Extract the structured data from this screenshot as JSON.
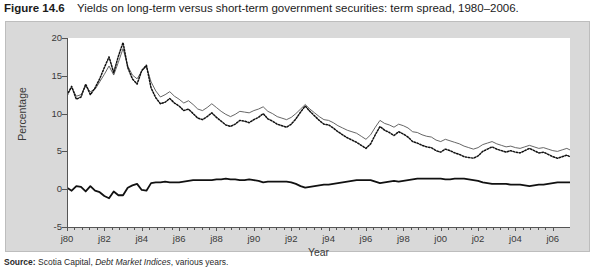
{
  "caption": {
    "figure_number": "Figure 14.6",
    "text": "Yields on long-term versus short-term government securities: term spread, 1980–2006."
  },
  "source": {
    "label": "Source:",
    "publisher": "Scotia Capital,",
    "publication": "Debt Market Indices",
    "suffix": ", various years."
  },
  "colors": {
    "panel_background": "#d9d9d9",
    "plot_background": "#ffffff",
    "axis": "#555555",
    "lt_bond": "#555555",
    "st_bond": "#111111",
    "spread": "#111111",
    "text": "#3a3a3a"
  },
  "chart_data": {
    "type": "line",
    "title": "Yields on long-term versus short-term government securities: term spread, 1980–2006",
    "xlabel": "Year",
    "ylabel": "Percentage",
    "ylim": [
      -5,
      20
    ],
    "yticks": [
      -5,
      0,
      5,
      10,
      15,
      20
    ],
    "ytick_labels": [
      "-5",
      "0",
      "5",
      "10",
      "15",
      "20"
    ],
    "xlim": [
      1980,
      2006.92
    ],
    "xticks": [
      1980,
      1982,
      1984,
      1986,
      1988,
      1990,
      1992,
      1994,
      1996,
      1998,
      2000,
      2002,
      2004,
      2006
    ],
    "xtick_labels": [
      "j80",
      "j82",
      "j84",
      "j86",
      "j88",
      "j90",
      "j92",
      "j94",
      "j96",
      "j98",
      "j00",
      "j02",
      "j04",
      "j06"
    ],
    "minor_xticks_per_interval": 4,
    "grid": false,
    "legend_position": "top-right",
    "x_start": 1980.0,
    "x_step": 0.25,
    "series": [
      {
        "name": "LT bond",
        "style": "solid-thin",
        "color": "#555555",
        "values": [
          12.6,
          13.4,
          12.3,
          12.5,
          13.6,
          12.9,
          13.2,
          14.2,
          15.2,
          16.3,
          15.1,
          16.8,
          18.6,
          16.3,
          15.1,
          14.6,
          15.6,
          16.2,
          14.2,
          13.0,
          12.2,
          12.5,
          12.9,
          12.3,
          11.9,
          11.4,
          11.7,
          11.2,
          10.6,
          10.4,
          10.8,
          11.3,
          10.8,
          10.3,
          9.9,
          9.6,
          9.9,
          10.3,
          10.2,
          10.1,
          10.4,
          10.6,
          10.9,
          10.3,
          10.0,
          9.6,
          9.4,
          9.2,
          9.5,
          10.0,
          10.6,
          11.2,
          10.6,
          10.1,
          9.6,
          9.2,
          9.1,
          8.8,
          8.4,
          8.1,
          7.8,
          7.6,
          7.4,
          7.0,
          6.6,
          7.2,
          8.2,
          9.1,
          8.7,
          8.5,
          8.2,
          8.6,
          8.4,
          8.1,
          7.6,
          7.5,
          7.2,
          7.0,
          6.9,
          6.5,
          6.3,
          6.6,
          6.4,
          6.2,
          6.0,
          5.7,
          5.5,
          5.3,
          5.5,
          5.9,
          6.1,
          6.3,
          6.0,
          5.8,
          5.6,
          5.7,
          5.5,
          5.4,
          5.6,
          5.8,
          5.6,
          5.4,
          5.5,
          5.3,
          5.1,
          5.0,
          5.2,
          5.4,
          5.1,
          4.9,
          4.6,
          4.8,
          5.0,
          4.7,
          4.5,
          4.4,
          4.6,
          4.8,
          4.6,
          4.5,
          4.3,
          4.2,
          4.4,
          4.6,
          4.8,
          4.7,
          4.6,
          4.4,
          4.3,
          4.4,
          4.5,
          4.5
        ]
      },
      {
        "name": "ST bond",
        "style": "dotted",
        "color": "#111111",
        "values": [
          12.4,
          13.6,
          11.9,
          12.2,
          13.9,
          12.5,
          13.4,
          14.6,
          16.1,
          17.5,
          15.4,
          17.6,
          19.4,
          16.1,
          14.6,
          13.9,
          15.7,
          16.4,
          13.4,
          12.1,
          11.3,
          11.5,
          12.0,
          11.4,
          11.0,
          10.4,
          10.6,
          10.0,
          9.4,
          9.2,
          9.6,
          10.1,
          9.5,
          9.0,
          8.5,
          8.3,
          8.6,
          9.1,
          9.0,
          8.8,
          9.2,
          9.5,
          10.0,
          9.3,
          9.0,
          8.6,
          8.4,
          8.2,
          8.6,
          9.3,
          10.2,
          11.0,
          10.3,
          9.7,
          9.1,
          8.6,
          8.5,
          8.1,
          7.6,
          7.2,
          6.8,
          6.5,
          6.2,
          5.8,
          5.4,
          6.0,
          7.2,
          8.3,
          7.8,
          7.5,
          7.1,
          7.6,
          7.3,
          6.9,
          6.3,
          6.1,
          5.8,
          5.6,
          5.5,
          5.1,
          4.9,
          5.3,
          5.1,
          4.8,
          4.6,
          4.3,
          4.2,
          4.1,
          4.4,
          5.0,
          5.3,
          5.6,
          5.3,
          5.1,
          4.9,
          5.1,
          4.9,
          4.8,
          5.1,
          5.4,
          5.1,
          4.8,
          4.9,
          4.6,
          4.3,
          4.1,
          4.3,
          4.5,
          4.2,
          3.9,
          3.5,
          3.7,
          3.9,
          3.6,
          3.4,
          3.3,
          3.6,
          3.9,
          3.7,
          3.6,
          3.4,
          3.3,
          3.6,
          3.9,
          4.1,
          4.0,
          3.9,
          3.8,
          3.9,
          4.1,
          4.2,
          4.2
        ]
      },
      {
        "name": "Spread",
        "style": "solid-thick",
        "color": "#111111",
        "values": [
          0.2,
          -0.2,
          0.4,
          0.3,
          -0.3,
          0.4,
          -0.2,
          -0.4,
          -0.9,
          -1.2,
          -0.3,
          -0.8,
          -0.8,
          0.2,
          0.5,
          0.7,
          -0.1,
          -0.2,
          0.8,
          0.9,
          0.9,
          1.0,
          0.9,
          0.9,
          0.9,
          1.0,
          1.1,
          1.2,
          1.2,
          1.2,
          1.2,
          1.2,
          1.3,
          1.3,
          1.4,
          1.3,
          1.3,
          1.2,
          1.2,
          1.3,
          1.2,
          1.1,
          0.9,
          1.0,
          1.0,
          1.0,
          1.0,
          1.0,
          0.9,
          0.7,
          0.4,
          0.2,
          0.3,
          0.4,
          0.5,
          0.6,
          0.6,
          0.7,
          0.8,
          0.9,
          1.0,
          1.1,
          1.2,
          1.2,
          1.2,
          1.2,
          1.0,
          0.8,
          0.9,
          1.0,
          1.1,
          1.0,
          1.1,
          1.2,
          1.3,
          1.4,
          1.4,
          1.4,
          1.4,
          1.4,
          1.4,
          1.3,
          1.3,
          1.4,
          1.4,
          1.4,
          1.3,
          1.2,
          1.1,
          0.9,
          0.8,
          0.7,
          0.7,
          0.7,
          0.7,
          0.6,
          0.6,
          0.6,
          0.5,
          0.4,
          0.5,
          0.6,
          0.6,
          0.7,
          0.8,
          0.9,
          0.9,
          0.9,
          0.9,
          1.0,
          1.1,
          1.1,
          1.1,
          1.1,
          1.1,
          1.1,
          1.0,
          0.9,
          0.9,
          0.9,
          0.9,
          0.9,
          0.8,
          0.7,
          0.7,
          0.7,
          0.7,
          0.6,
          0.4,
          0.3,
          0.3,
          0.3
        ]
      }
    ]
  },
  "legend": {
    "items": [
      {
        "label": "LT bond",
        "style": "solid-thin"
      },
      {
        "label": "ST bond",
        "style": "dotted"
      },
      {
        "label": "Spread",
        "style": "solid-thick"
      }
    ]
  }
}
